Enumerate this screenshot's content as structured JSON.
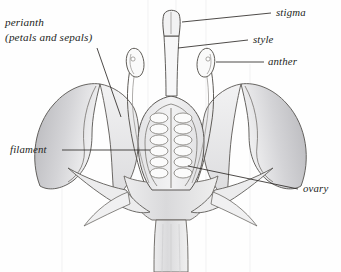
{
  "figure": {
    "style": "pencil-line-drawing",
    "ink": "#3a3734",
    "shade_light": "#e9e9ea",
    "shade_mid": "#cfcfd2",
    "shade_dark": "#b3b3b7"
  },
  "labels": {
    "perianth_line1": "perianth",
    "perianth_line2": "(petals and sepals)",
    "stigma": "stigma",
    "style": "style",
    "anther": "anther",
    "filament": "filament",
    "ovary": "ovary"
  },
  "parts": [
    {
      "name": "stigma",
      "description": "flared tip at top of style"
    },
    {
      "name": "style",
      "description": "narrow column below stigma"
    },
    {
      "name": "anther",
      "description": "paired oval pollen sacs on filaments"
    },
    {
      "name": "filament",
      "description": "slender stalk supporting anther"
    },
    {
      "name": "ovary",
      "description": "central chamber containing two rows of ovules"
    },
    {
      "name": "perianth",
      "description": "petals and sepals surrounding reproductive parts"
    },
    {
      "name": "receptacle",
      "description": "flared base joining stem"
    },
    {
      "name": "stem",
      "description": "vertical stalk at bottom"
    }
  ]
}
